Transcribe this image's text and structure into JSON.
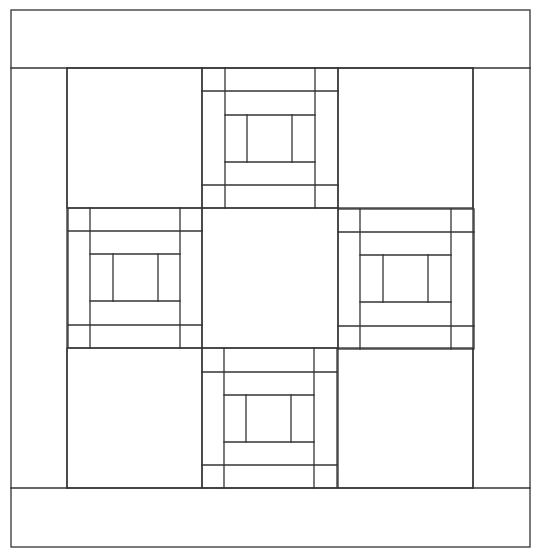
{
  "diagram": {
    "stroke": "#333333",
    "stroke_width": 1.3,
    "background": "#ffffff",
    "outer_frame": {
      "x1": 11,
      "y1": 10,
      "x2": 530,
      "y2": 547
    },
    "bands": {
      "top_band_bottom_y": 68,
      "bottom_band_top_y": 488,
      "left_band_right_x": 67,
      "right_band_left_x": 473
    },
    "log_cabin_blocks": [
      {
        "name": "top",
        "xs": [
          202,
          225,
          247,
          292,
          315,
          338
        ],
        "ys": [
          68,
          91,
          115,
          162,
          185,
          208
        ]
      },
      {
        "name": "left",
        "xs": [
          68,
          90,
          113,
          158,
          180,
          202
        ],
        "ys": [
          208,
          231,
          254,
          301,
          325,
          348
        ]
      },
      {
        "name": "right",
        "xs": [
          338,
          360,
          383,
          428,
          451,
          474
        ],
        "ys": [
          209,
          232,
          255,
          302,
          326,
          349
        ]
      },
      {
        "name": "bottom",
        "xs": [
          202,
          224,
          246,
          291,
          314,
          337
        ],
        "ys": [
          348,
          372,
          395,
          442,
          465,
          488
        ]
      }
    ],
    "center_square": {
      "x1": 202,
      "y1": 208,
      "x2": 338,
      "y2": 348
    },
    "corner_squares": [
      {
        "name": "top-left",
        "x1": 67,
        "y1": 68,
        "x2": 202,
        "y2": 208
      },
      {
        "name": "top-right",
        "x1": 338,
        "y1": 68,
        "x2": 473,
        "y2": 208
      },
      {
        "name": "bottom-left",
        "x1": 67,
        "y1": 348,
        "x2": 202,
        "y2": 488
      },
      {
        "name": "bottom-right",
        "x1": 338,
        "y1": 348,
        "x2": 473,
        "y2": 488
      }
    ]
  }
}
